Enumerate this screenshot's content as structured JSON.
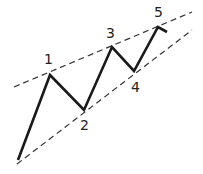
{
  "diagram": {
    "type": "elliott-wave-impulse",
    "colors": {
      "wave": "#1a1a1a",
      "channel": "#333333",
      "label": "#222222",
      "background": "#ffffff"
    },
    "wave_points": [
      [
        18,
        160
      ],
      [
        50,
        75
      ],
      [
        84,
        110
      ],
      [
        112,
        47
      ],
      [
        134,
        71
      ],
      [
        158,
        27
      ],
      [
        167,
        32
      ]
    ],
    "upper_channel": [
      [
        14,
        87
      ],
      [
        192,
        12
      ]
    ],
    "lower_channel": [
      [
        17,
        164
      ],
      [
        192,
        30
      ]
    ],
    "labels": [
      {
        "text": "1",
        "x": 44,
        "y": 52
      },
      {
        "text": "2",
        "x": 80,
        "y": 118
      },
      {
        "text": "3",
        "x": 106,
        "y": 26
      },
      {
        "text": "4",
        "x": 131,
        "y": 80
      },
      {
        "text": "5",
        "x": 154,
        "y": 5
      }
    ]
  }
}
